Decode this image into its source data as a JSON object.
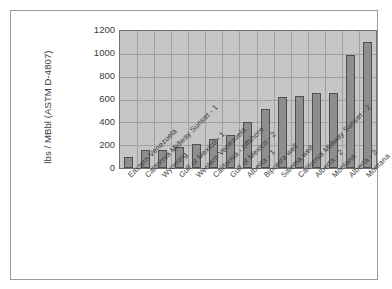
{
  "chart_data": {
    "type": "bar",
    "title": "",
    "xlabel": "",
    "ylabel": "lbs / MBbl (ASTM D-4807)",
    "ylim": [
      0,
      1200
    ],
    "ytick_labels": [
      "1200",
      "1000",
      "800",
      "600",
      "400",
      "200",
      "0"
    ],
    "ytick_values": [
      1200,
      1000,
      800,
      600,
      400,
      200,
      0
    ],
    "grid": true,
    "legend": "none",
    "plot_background": "#c6c6c6",
    "bar_color": "#8e8e8e",
    "bar_edge_color": "#4e4e4e",
    "categories": [
      "Eastern Venezuela",
      "California Midway Sunset - 1",
      "Wyoming",
      "Gulf of Mexico - 1",
      "Western Venezuela",
      "California - offshore",
      "Gulf of Mexico - 2",
      "Alberta - 1",
      "Bipupira well",
      "Salema well",
      "California Midway Sunset - 2",
      "Alberta - 2",
      "Montana",
      "Alberta - 3",
      "Montana"
    ],
    "values": [
      100,
      160,
      160,
      180,
      210,
      255,
      285,
      400,
      520,
      620,
      630,
      660,
      660,
      990,
      1100
    ]
  }
}
